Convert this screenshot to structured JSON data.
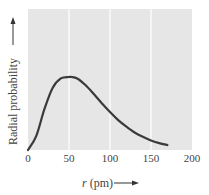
{
  "chart_data": {
    "type": "line",
    "title": "",
    "xlabel": "r (pm)",
    "xlabel_var": "r",
    "xlabel_unit": "(pm)",
    "ylabel": "Radial probability",
    "xlim": [
      0,
      200
    ],
    "ylim": [
      0,
      1.0
    ],
    "x_ticks": [
      0,
      50,
      100,
      150,
      200
    ],
    "x_tick_labels": [
      "0",
      "50",
      "100",
      "150",
      "200"
    ],
    "y_ticks": [],
    "grid": {
      "vertical": true,
      "horizontal": false,
      "color": "#ffffff"
    },
    "background": "#e6e6e6",
    "line_color": "#3a3a3a",
    "series": [
      {
        "name": "Radial probability",
        "x": [
          0,
          10,
          20,
          30,
          40,
          50,
          53,
          60,
          70,
          80,
          90,
          100,
          110,
          120,
          130,
          140,
          150,
          160,
          170
        ],
        "values": [
          0,
          0.19,
          0.56,
          0.85,
          0.98,
          1.0,
          1.0,
          0.98,
          0.89,
          0.77,
          0.64,
          0.52,
          0.41,
          0.32,
          0.24,
          0.18,
          0.13,
          0.095,
          0.068
        ]
      }
    ],
    "annotations": [
      {
        "text": "peak near 50 pm",
        "x": 53
      }
    ]
  }
}
